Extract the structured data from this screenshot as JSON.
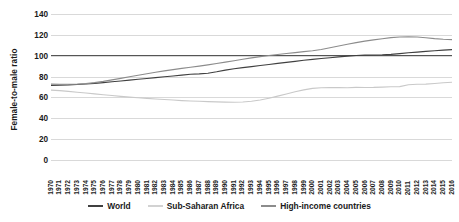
{
  "chart_data": {
    "type": "line",
    "title": "",
    "xlabel": "",
    "ylabel": "Female-to-male ratio",
    "ylim": [
      0,
      140
    ],
    "yticks": [
      0,
      20,
      40,
      60,
      80,
      100,
      120,
      140
    ],
    "grid": true,
    "legend_position": "bottom",
    "reference_line": 100,
    "x": [
      1970,
      1971,
      1972,
      1973,
      1974,
      1975,
      1976,
      1977,
      1978,
      1979,
      1980,
      1981,
      1982,
      1983,
      1984,
      1985,
      1986,
      1987,
      1988,
      1989,
      1990,
      1991,
      1992,
      1993,
      1994,
      1995,
      1996,
      1997,
      1998,
      1999,
      2000,
      2001,
      2002,
      2003,
      2004,
      2005,
      2006,
      2007,
      2008,
      2009,
      2010,
      2011,
      2012,
      2013,
      2014,
      2015,
      2016
    ],
    "series": [
      {
        "name": "World",
        "color": "#404040",
        "values": [
          71.5,
          71.8,
          72.0,
          72.4,
          72.9,
          73.5,
          74.2,
          75.0,
          75.8,
          76.6,
          77.4,
          78.2,
          79.0,
          79.8,
          80.6,
          81.4,
          82.2,
          82.6,
          83.2,
          84.6,
          86.2,
          87.5,
          88.6,
          89.6,
          90.6,
          91.6,
          92.6,
          93.6,
          94.6,
          95.6,
          96.5,
          97.3,
          98.1,
          98.9,
          99.6,
          100.2,
          100.5,
          100.7,
          100.9,
          101.3,
          102.0,
          102.8,
          103.5,
          104.2,
          104.8,
          105.3,
          105.8
        ]
      },
      {
        "name": "Sub-Saharan Africa",
        "color": "#c9c9c9",
        "values": [
          67.0,
          66.5,
          65.8,
          65.0,
          64.2,
          63.4,
          62.6,
          61.8,
          61.0,
          60.3,
          59.7,
          59.1,
          58.5,
          58.0,
          57.5,
          57.0,
          56.6,
          56.3,
          56.0,
          55.7,
          55.5,
          55.4,
          55.6,
          56.3,
          57.5,
          59.2,
          61.2,
          63.3,
          65.4,
          67.3,
          68.7,
          69.3,
          69.5,
          69.4,
          69.3,
          69.6,
          69.5,
          69.6,
          69.9,
          70.2,
          70.4,
          72.2,
          72.6,
          72.8,
          73.4,
          74.1,
          74.6
        ]
      },
      {
        "name": "High-income countries",
        "color": "#8c8c8c",
        "values": [
          72.8,
          72.6,
          72.6,
          72.8,
          73.3,
          74.2,
          75.4,
          76.8,
          78.3,
          79.8,
          81.3,
          82.7,
          84.1,
          85.4,
          86.6,
          87.8,
          88.9,
          90.0,
          91.2,
          92.5,
          93.8,
          95.2,
          96.6,
          97.9,
          99.1,
          100.2,
          101.2,
          102.1,
          103.0,
          103.9,
          104.8,
          106.0,
          107.6,
          109.3,
          111.0,
          112.6,
          114.0,
          115.2,
          116.3,
          117.3,
          117.9,
          118.2,
          117.9,
          117.2,
          116.4,
          115.8,
          115.4
        ]
      }
    ]
  },
  "legend": {
    "items": [
      {
        "label": "World",
        "color": "#404040"
      },
      {
        "label": "Sub-Saharan Africa",
        "color": "#d2d2d2"
      },
      {
        "label": "High-income countries",
        "color": "#8c8c8c"
      }
    ]
  }
}
